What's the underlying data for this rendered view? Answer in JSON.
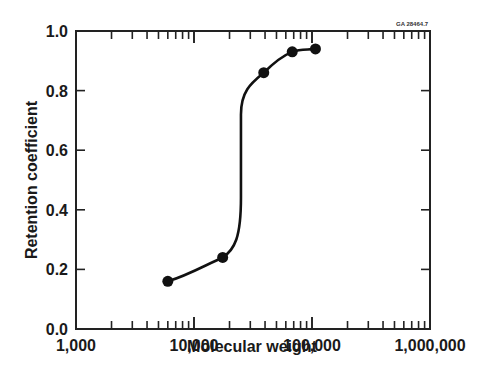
{
  "chart_data": {
    "type": "line",
    "title": "",
    "annotation": "GA 28464.7",
    "xlabel": "Molecular weight",
    "ylabel": "Retention coefficient",
    "xscale": "log",
    "xlim": [
      1000,
      1000000
    ],
    "ylim": [
      0.0,
      1.0
    ],
    "x_tick_labels": [
      "1,000",
      "10,000",
      "100,000",
      "1,000,000"
    ],
    "x_tick_values": [
      1000,
      10000,
      100000,
      1000000
    ],
    "y_tick_labels": [
      "0.0",
      "0.2",
      "0.4",
      "0.6",
      "0.8",
      "1.0"
    ],
    "y_tick_values": [
      0.0,
      0.2,
      0.4,
      0.6,
      0.8,
      1.0
    ],
    "grid": false,
    "legend": null,
    "series": [
      {
        "name": "Retention coefficient",
        "marker": "filled-circle",
        "color": "#111111",
        "x": [
          6000,
          17500,
          39000,
          68000,
          107000
        ],
        "y": [
          0.16,
          0.24,
          0.86,
          0.93,
          0.94
        ]
      }
    ],
    "curve_note": "Smooth sigmoidal fit; steep near-vertical rise at ~25,000 between 0.24 and 0.86"
  },
  "colors": {
    "axis": "#222222",
    "line": "#111111",
    "background": "#ffffff"
  }
}
